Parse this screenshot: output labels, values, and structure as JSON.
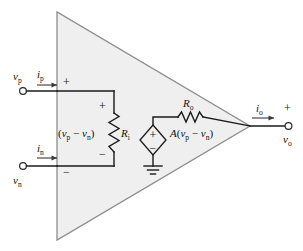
{
  "figure": {
    "background_color": "#ffffff",
    "body_fill_color": "#efeff0",
    "line_color": "#1a1a1a",
    "outline_color": "#8d8d8d"
  },
  "labels": {
    "v_p": "v",
    "v_p_sub": "p",
    "i_p": "i",
    "i_p_sub": "p",
    "v_n": "v",
    "v_n_sub": "n",
    "i_n": "i",
    "i_n_sub": "n",
    "v_o": "v",
    "v_o_sub": "o",
    "i_o": "i",
    "i_o_sub": "o",
    "R_i": "R",
    "R_i_sub": "i",
    "R_o": "R",
    "R_o_sub": "o",
    "diff_open": "(",
    "diff_v1": "v",
    "diff_v1_sub": "p",
    "diff_minus": "−",
    "diff_v2": "v",
    "diff_v2_sub": "n",
    "diff_close": ")",
    "gain": "A",
    "gain_open": "(",
    "gain_v1": "v",
    "gain_v1_sub": "p",
    "gain_minus": "−",
    "gain_v2": "v",
    "gain_v2_sub": "n",
    "gain_close": ")",
    "plus": "+",
    "minus": "−"
  },
  "components": {
    "input_resistor_name": "R_i",
    "output_resistor_name": "R_o",
    "dependent_source_name": "A(v_p - v_n)",
    "ground_name": "ground",
    "terminals": [
      "non-inverting input terminal",
      "inverting input terminal",
      "output terminal"
    ]
  }
}
